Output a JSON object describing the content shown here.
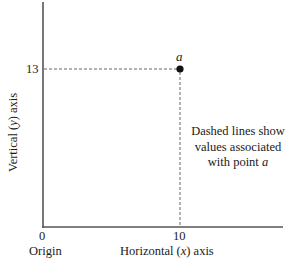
{
  "diagram": {
    "type": "coordinate-axes",
    "y_axis": {
      "title_prefix": "Vertical (",
      "title_var": "y",
      "title_suffix": ") axis",
      "tick_label": "13",
      "tick_value": 13
    },
    "x_axis": {
      "title_prefix": "Horizontal (",
      "title_var": "x",
      "title_suffix": ") axis",
      "tick_label": "10",
      "tick_value": 10
    },
    "origin": {
      "value_label": "0",
      "name_label": "Origin"
    },
    "point": {
      "label": "a",
      "x": 10,
      "y": 13
    },
    "annotation": {
      "line1": "Dashed lines show",
      "line2": "values associated",
      "line3_prefix": "with point ",
      "line3_var": "a"
    },
    "colors": {
      "axis": "#555555",
      "dashed": "#555555",
      "point": "#111111",
      "text": "#1a1a1a"
    }
  }
}
